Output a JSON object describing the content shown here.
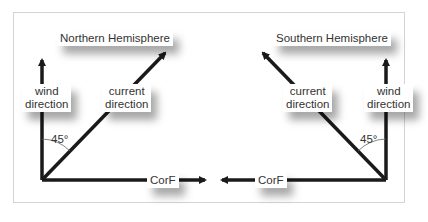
{
  "northern": {
    "title": "Northern Hemisphere",
    "wind_label_1": "wind",
    "wind_label_2": "direction",
    "current_label_1": "current",
    "current_label_2": "direction",
    "angle": "45°",
    "force_label": "CorF"
  },
  "southern": {
    "title": "Southern Hemisphere",
    "wind_label_1": "wind",
    "wind_label_2": "direction",
    "current_label_1": "current",
    "current_label_2": "direction",
    "angle": "45°",
    "force_label": "CorF"
  },
  "colors": {
    "line": "#1a1a1a",
    "text": "#333333",
    "frame": "#d4d4d4"
  }
}
